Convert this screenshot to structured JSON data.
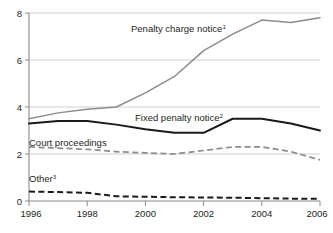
{
  "chart_data": {
    "type": "line",
    "title": "",
    "xlabel": "",
    "ylabel": "",
    "xlim": [
      1996,
      2006
    ],
    "ylim": [
      0,
      8
    ],
    "grid": true,
    "legend_position": "inline-annotations",
    "x": [
      1996,
      1997,
      1998,
      1999,
      2000,
      2001,
      2002,
      2003,
      2004,
      2005,
      2006
    ],
    "y_ticks": [
      0,
      2,
      4,
      6,
      8
    ],
    "y_tick_labels": [
      "0",
      "2",
      "4",
      "6",
      "8"
    ],
    "x_ticks": [
      1996,
      1997,
      1998,
      1999,
      2000,
      2001,
      2002,
      2003,
      2004,
      2005,
      2006
    ],
    "x_tick_labels": [
      "1996",
      "",
      "1998",
      "",
      "2000",
      "",
      "2002",
      "",
      "2004",
      "",
      "2006"
    ],
    "x_tick_labels_shown": [
      "1996",
      "1998",
      "2000",
      "2002",
      "2004",
      "2006"
    ],
    "series": [
      {
        "name": "Penalty charge notice",
        "superscript": "1",
        "style": "solid",
        "color": "#8c8c8c",
        "values": [
          3.5,
          3.75,
          3.9,
          4.0,
          4.6,
          5.3,
          6.4,
          7.1,
          7.7,
          7.6,
          7.8
        ]
      },
      {
        "name": "Fixed penalty notice",
        "superscript": "2",
        "style": "solid",
        "color": "#1a1a1a",
        "values": [
          3.3,
          3.4,
          3.4,
          3.25,
          3.05,
          2.9,
          2.9,
          3.5,
          3.5,
          3.3,
          3.0
        ]
      },
      {
        "name": "Court proceedings",
        "superscript": "",
        "style": "dashed",
        "color": "#8c8c8c",
        "values": [
          2.3,
          2.25,
          2.2,
          2.1,
          2.05,
          2.0,
          2.15,
          2.3,
          2.3,
          2.1,
          1.75
        ]
      },
      {
        "name": "Other",
        "superscript": "3",
        "style": "dashed",
        "color": "#1a1a1a",
        "values": [
          0.4,
          0.38,
          0.35,
          0.2,
          0.18,
          0.16,
          0.15,
          0.14,
          0.12,
          0.1,
          0.1
        ]
      }
    ],
    "annotations": [
      {
        "text": "Penalty charge notice",
        "superscript": "1",
        "x_px": 131,
        "y_px": 32
      },
      {
        "text": "Fixed penalty notice",
        "superscript": "2",
        "x_px": 135,
        "y_px": 121
      },
      {
        "text": "Court proceedings",
        "superscript": "",
        "x_px": 29,
        "y_px": 146
      },
      {
        "text": "Other",
        "superscript": "3",
        "x_px": 29,
        "y_px": 182
      }
    ]
  },
  "colors": {
    "penalty_charge_notice": "#8c8c8c",
    "fixed_penalty_notice": "#1a1a1a",
    "court_proceedings": "#8c8c8c",
    "other": "#1a1a1a",
    "gridline": "#c9c9c9",
    "axis": "#8a8a8a",
    "text": "#231f20",
    "background": "#ffffff"
  }
}
